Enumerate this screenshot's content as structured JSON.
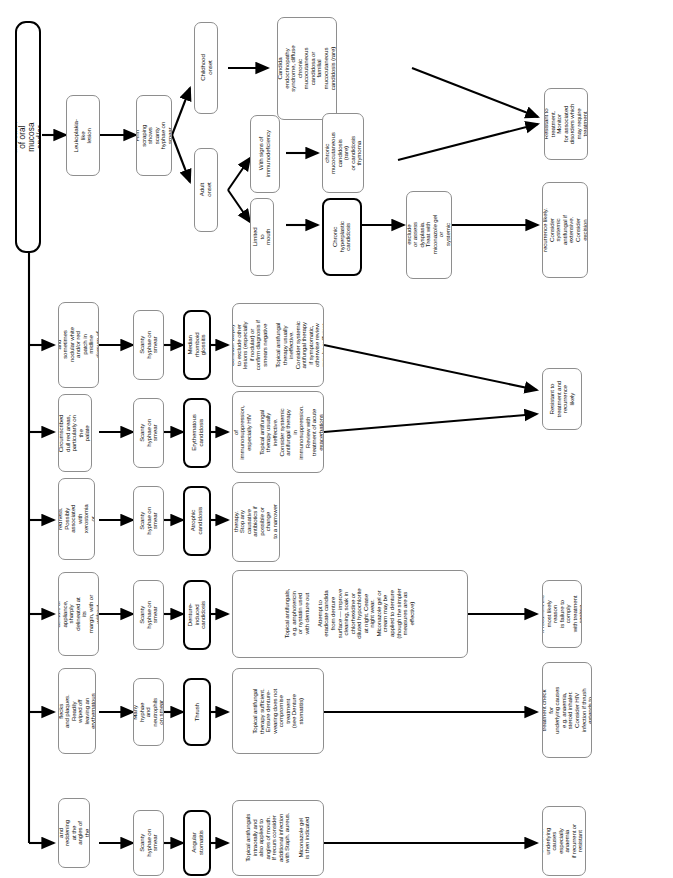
{
  "diagram": {
    "title": "Candidal infection of oral mucosa and/or lips",
    "type": "clinical-decision-flowchart",
    "orientation": "rotated-90-left",
    "root": {
      "label": "Candidal infection of oral mucosa and/or lips"
    },
    "columns": [
      "Presentation",
      "Smear findings",
      "Diagnosis",
      "Management",
      "Outcome / follow-up"
    ],
    "branches": [
      {
        "id": "leukoplakia",
        "presentation": "Leukoplakia-like\nlesion",
        "smear": "Firm scraping\nshows scanty\nhyphae on smear",
        "splits": [
          {
            "id": "childhood-onset",
            "label": "Childhood onset",
            "diagnosis": "Candida\nendocrinopathy\nsyndrome, diffuse\nchronic\nmucocutaneous\ncandidosa or\nfamilial\nmucocutaneous\ncandidosis (rare)",
            "outcome": "Resistant to\ntreatment. Monitor\nfor associated\ndisorders which\nmay require\ntreatment"
          },
          {
            "id": "adult-onset",
            "label": "Adult onset",
            "subsplits": [
              {
                "id": "with-immunodeficiency",
                "label": "With signs of\nimmunodeficiency",
                "diagnosis": "Late onset chronic\nmucocutaneous\ncandidosis (rare)\nor candidosis\nthymoma\nsyndrome",
                "outcome": "Resistant to\ntreatment. Monitor\nfor associated\ndisorders which\nmay require\ntreatment"
              },
              {
                "id": "limited-to-mouth",
                "label": "Limited to mouth",
                "diagnosis": "Chronic\nhyperplastic\ncandidosis",
                "management": "Biopsy to exclude\nor assess\ndysplasia.\nTreat with\nmiconazole gel or\nsystemic antifungal",
                "outcome": "Resistant to\ntreatment and\nrecurrence likely.\nConsider systemic\nantifungal if\nextensive.\nConsider excision\nif dysplasia\npresent"
              }
            ]
          }
        ]
      }
    ],
    "rows": [
      {
        "id": "median-rhomboid-glossitis",
        "presentation": "Depapillated\nand sometimes\nnodular white\nand/or red patch in\nmidline dorsum of\ntongue",
        "smear": "Scanty hyphae on\nsmear",
        "diagnosis": "Median rhomboid\nglossitis",
        "management": "Consider biopsy\nto exclude other\nlesions (especially\nif nodular) or\nconfirm diagnosis if\nsmears negative\n\nTopical antifungal\ntherapy usually\nineffective.\nConsider systemic\nantifungal therapy\nif symptomatic,\notherwise review\nmay be sufficient",
        "outcome": "Resistant to\ntreatment and\nrecurrence likely",
        "shared_outcome": true
      },
      {
        "id": "erythematous-candidosis",
        "presentation": "Circumscribed\ndull red areas,\nparticularly on the\npalate",
        "smear": "Scanty hyphae on\nsmear",
        "diagnosis": "Erythematous\ncandidosis",
        "management": "Highly suggestive\nof\nimmunosuppression,\nespecially HIV\n\nTopical antifungal\ntherapy usually\nineffective.\nConsider systemic\nantifungal therapy\nin\nimmunosuppression.\nReview with\ntreatment of acute\nexacerbations\nmay be sufficient",
        "outcome": "Resistant to\ntreatment and\nrecurrence likely",
        "shared_outcome": true
      },
      {
        "id": "atrophic-candidosis",
        "presentation": "Generalised\nmucosal redness.\nPossibly\nassociated with\nxerostomia or\nantibiotic treatment",
        "smear": "Scanty hyphae on\nsmear",
        "diagnosis": "Atrophic\ncandidosis",
        "management": "Topical antifungal\ntherapy.\nStop any causative\nantibiotics if\npossible or change\nto a narrower\nspectrum drug",
        "outcome": null
      },
      {
        "id": "denture-induced-candidosis",
        "presentation": "Red area beneath\ndenture or\nappliance, sharply\ndelineated at its\nmargin, with or\nwithout angular\ncheilitis",
        "smear": "Scanty hyphae on\nsmear",
        "diagnosis": "Denture-induced\ncandidosis",
        "management": "Topical antifungals,\ne.g. amphotericin\nor nystatin used\nwith denture out\n\nAttempt to\neradicate candida\nfrom denture\nsurface — improve\ncleaning, soak in\nchlorhexidine or\ndiluted hypochlorite\nat night. Cease\nnight wear.\nMiconazole gel or\ncream may be\napplied to denture\n(though the simpler\nmeasures are as\neffective)",
        "outcome": "If recurrent the\nmost likely reason\nis failure to comply\nwith treatment\nregime"
      },
      {
        "id": "thrush",
        "presentation": "Soft white flecks\nand plaques.\nReadily wiped off\nleaving an\nerythematous\nbackground",
        "smear": "Many hyphae and\nneutrophils\non smear",
        "diagnosis": "Thrush",
        "management": "Topical antifungal\ntherapy sufficient.\nEnsure denture-\nwearing does not\ncompromise\ntreatment\n(see Denture\nstomatitis)",
        "outcome": "If recurrent or\nresistant to\ntreatment check for\nunderlying causes\ne.g. anaemia,\nsteroid inhaler.\nConsider HIV\ninfection if thrush\nextends to pharynx\nor oesophagus"
      },
      {
        "id": "angular-stomatitis",
        "presentation": "Cracking and\nreddening at the\nangles of the\nmouth",
        "smear": "Scanty hyphae on\nsmear",
        "diagnosis": "Angular stomatitis",
        "management": "Topical antifungals\nintraorally and\nalso applied to\nangles of mouth.\nIf recurs consider\nadditional infection\nwith Staph. aureus.\n\nMiconazole gel\nis then indicated",
        "outcome": "Check for\nunderlying causes\nespecially anaemia\nif recurrent or\nresistant\nto treatment"
      }
    ],
    "shared_outcomes": {
      "top_right": "Resistant to\ntreatment. Monitor\nfor associated\ndisorders which\nmay require\ntreatment",
      "mid_right": "Resistant to\ntreatment and\nrecurrence likely"
    },
    "colors": {
      "box_border": "#8e8e8e",
      "emphasis_border": "#000000",
      "background": "#ffffff",
      "text": "#111111",
      "connector": "#000000"
    }
  }
}
